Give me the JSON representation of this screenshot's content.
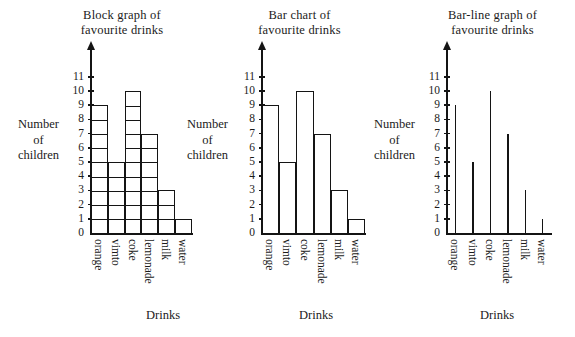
{
  "figure": {
    "axis_caption_y": [
      "Number",
      "of",
      "children"
    ],
    "axis_caption_x": "Drinks",
    "y_ticks": [
      "0",
      "1",
      "2",
      "3",
      "4",
      "5",
      "6",
      "7",
      "8",
      "9",
      "10",
      "11"
    ],
    "ink_color": "#141414",
    "background_color": "#ffffff"
  },
  "panels": [
    {
      "id": "block",
      "title_lines": [
        "Block graph of",
        "favourite drinks"
      ],
      "chart_type": "bar"
    },
    {
      "id": "bar",
      "title_lines": [
        "Bar chart of",
        "favourite drinks"
      ],
      "chart_type": "bar"
    },
    {
      "id": "line",
      "title_lines": [
        "Bar-line graph of",
        "favourite drinks"
      ],
      "chart_type": "bar"
    }
  ],
  "chart_data": [
    {
      "type": "bar",
      "title": "Block graph of favourite drinks",
      "style": "block-graph-unit-squares",
      "categories": [
        "orange",
        "vimto",
        "coke",
        "lemonade",
        "milk",
        "water"
      ],
      "values": [
        9,
        5,
        10,
        7,
        3,
        1
      ],
      "xlabel": "Drinks",
      "ylabel": "Number of children",
      "ylim": [
        0,
        11
      ],
      "ytick_step": 1,
      "yticks": [
        0,
        1,
        2,
        3,
        4,
        5,
        6,
        7,
        8,
        9,
        10,
        11
      ],
      "grid": false,
      "legend": "none",
      "bar_color": "#ffffff",
      "bar_edge_color": "#141414"
    },
    {
      "type": "bar",
      "title": "Bar chart of favourite drinks",
      "style": "adjacent-outlined-bars",
      "categories": [
        "orange",
        "vimto",
        "coke",
        "lemonade",
        "milk",
        "water"
      ],
      "values": [
        9,
        5,
        10,
        7,
        3,
        1
      ],
      "xlabel": "Drinks",
      "ylabel": "Number of children",
      "ylim": [
        0,
        11
      ],
      "ytick_step": 1,
      "yticks": [
        0,
        1,
        2,
        3,
        4,
        5,
        6,
        7,
        8,
        9,
        10,
        11
      ],
      "grid": false,
      "legend": "none",
      "bar_color": "#ffffff",
      "bar_edge_color": "#141414"
    },
    {
      "type": "bar",
      "title": "Bar-line graph of favourite drinks",
      "style": "thin-vertical-lines",
      "categories": [
        "orange",
        "vimto",
        "coke",
        "lemonade",
        "milk",
        "water"
      ],
      "values": [
        9,
        5,
        10,
        7,
        3,
        1
      ],
      "xlabel": "Drinks",
      "ylabel": "Number of children",
      "ylim": [
        0,
        11
      ],
      "ytick_step": 1,
      "yticks": [
        0,
        1,
        2,
        3,
        4,
        5,
        6,
        7,
        8,
        9,
        10,
        11
      ],
      "grid": false,
      "legend": "none",
      "bar_color": "#141414",
      "bar_edge_color": "#141414"
    }
  ]
}
